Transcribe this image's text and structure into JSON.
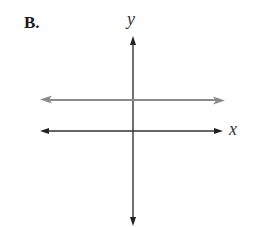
{
  "figure": {
    "option_label": "B.",
    "axes": {
      "x_label": "x",
      "y_label": "y",
      "axis_color": "#333333",
      "origin_px": [
        133,
        131
      ]
    },
    "lines": [
      {
        "name": "horizontal-line",
        "description": "Horizontal line above the x-axis (y = positive constant), arrows both ends",
        "color": "#888888",
        "y_px": 100,
        "x_start_px": 40,
        "x_end_px": 225
      }
    ]
  }
}
